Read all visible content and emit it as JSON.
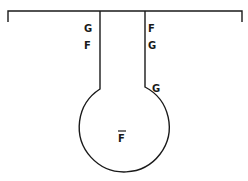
{
  "diagram": {
    "stroke_color": "#1a1a1a",
    "background": "#ffffff",
    "labels": {
      "left_upper": "G",
      "left_lower": "F",
      "right_upper": "F",
      "right_middle": "G",
      "right_neck": "G",
      "bulb_center": "F"
    },
    "bulb_center_overline": true
  }
}
